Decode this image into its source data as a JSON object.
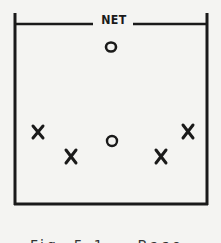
{
  "diagram": {
    "net_label": "NET",
    "players": [
      {
        "marker": "O",
        "x": 111,
        "y": 48
      },
      {
        "marker": "X",
        "x": 38,
        "y": 133
      },
      {
        "marker": "X",
        "x": 71,
        "y": 156
      },
      {
        "marker": "O",
        "x": 112,
        "y": 141
      },
      {
        "marker": "X",
        "x": 161,
        "y": 156
      },
      {
        "marker": "X",
        "x": 188,
        "y": 132
      }
    ],
    "caption": "Fig. 5-1 — Base Formation"
  }
}
